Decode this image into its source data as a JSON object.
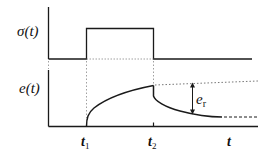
{
  "diagram": {
    "upper_plot": {
      "ylabel": "σ(t)",
      "description": "rectangular stress pulse applied from t1 to t2"
    },
    "lower_plot": {
      "ylabel": "e(t)",
      "description": "strain rises during loading, partially recovers after unloading",
      "annotation": {
        "symbol": "e",
        "subscript": "r"
      }
    },
    "time_axis": {
      "ticks": [
        {
          "base": "t",
          "sub": "1"
        },
        {
          "base": "t",
          "sub": "2"
        }
      ],
      "label": "t"
    },
    "colors": {
      "line": "#1a1a1a",
      "guide": "#888888"
    }
  }
}
